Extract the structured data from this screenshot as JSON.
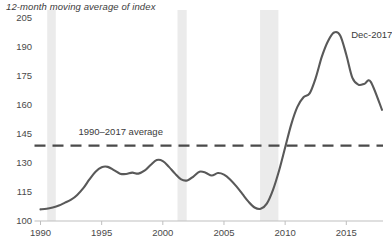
{
  "chart_data": {
    "type": "line",
    "title": "12-month moving average of index",
    "xlabel": "",
    "ylabel": "",
    "xlim": [
      1990,
      2018
    ],
    "ylim": [
      100,
      205
    ],
    "grid": false,
    "legend_position": "none",
    "y_ticks": [
      100,
      115,
      130,
      145,
      160,
      175,
      190,
      205
    ],
    "x_ticks": [
      1990,
      1995,
      2000,
      2005,
      2010,
      2015
    ],
    "line_color": "#595959",
    "band_color": "#ebebeb",
    "axis_color": "#bfbfbf",
    "annotations": [
      {
        "text": "Dec-2017",
        "x": 2015.4,
        "y": 196
      },
      {
        "text": "1990–2017 average",
        "x": 1993.1,
        "y": 146
      }
    ],
    "reference_line": {
      "label": "1990–2017 average",
      "value": 139,
      "style": "dashed",
      "color": "#4a4a4a"
    },
    "shaded_bands": [
      {
        "label": "recession-1990",
        "start": 1990.55,
        "end": 1991.25
      },
      {
        "label": "recession-2001",
        "start": 2001.2,
        "end": 2001.95
      },
      {
        "label": "recession-2008",
        "start": 2007.95,
        "end": 2009.45
      }
    ],
    "series": [
      {
        "name": "12-month moving average of index",
        "x": [
          1990.0,
          1990.5,
          1991.0,
          1991.5,
          1992.0,
          1992.5,
          1993.0,
          1993.5,
          1994.0,
          1994.5,
          1995.0,
          1995.5,
          1996.0,
          1996.5,
          1997.0,
          1997.5,
          1998.0,
          1998.5,
          1999.0,
          1999.5,
          2000.0,
          2000.5,
          2001.0,
          2001.5,
          2002.0,
          2002.5,
          2003.0,
          2003.5,
          2004.0,
          2004.5,
          2005.0,
          2005.5,
          2006.0,
          2006.5,
          2007.0,
          2007.5,
          2008.0,
          2008.5,
          2009.0,
          2009.5,
          2010.0,
          2010.5,
          2011.0,
          2011.5,
          2012.0,
          2012.5,
          2013.0,
          2013.5,
          2014.0,
          2014.5,
          2015.0,
          2015.5,
          2016.0,
          2016.5,
          2017.0,
          2017.92
        ],
        "values": [
          106.0,
          106.3,
          107.0,
          108.0,
          109.5,
          111.0,
          113.5,
          117.0,
          121.5,
          125.5,
          127.8,
          128.0,
          126.3,
          124.5,
          124.3,
          125.0,
          124.5,
          126.0,
          129.0,
          131.5,
          131.0,
          128.0,
          124.5,
          121.5,
          121.0,
          123.0,
          125.5,
          125.0,
          123.5,
          124.8,
          124.0,
          121.5,
          118.0,
          114.0,
          110.0,
          107.0,
          106.3,
          109.0,
          116.0,
          126.0,
          138.0,
          150.0,
          159.0,
          164.0,
          166.0,
          174.0,
          185.0,
          193.0,
          197.5,
          196.0,
          186.0,
          174.0,
          170.5,
          171.0,
          172.0,
          157.5
        ]
      }
    ]
  }
}
